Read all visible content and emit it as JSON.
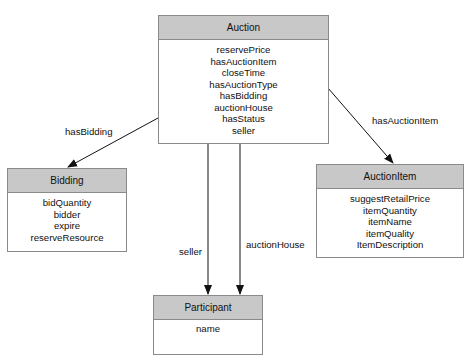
{
  "diagram": {
    "type": "class-relationship",
    "colors": {
      "header_fill": "#c8c8c8",
      "border": "#8a8a8a",
      "edge": "#111111",
      "background": "#ffffff"
    },
    "classes": {
      "auction": {
        "name": "Auction",
        "attributes": [
          "reservePrice",
          "hasAuctionItem",
          "closeTime",
          "hasAuctionType",
          "hasBidding",
          "auctionHouse",
          "hasStatus",
          "seller"
        ]
      },
      "bidding": {
        "name": "Bidding",
        "attributes": [
          "bidQuantity",
          "bidder",
          "expire",
          "reserveResource"
        ]
      },
      "auction_item": {
        "name": "AuctionItem",
        "attributes": [
          "suggestRetailPrice",
          "itemQuantity",
          "itemName",
          "itemQuality",
          "ItemDescription"
        ]
      },
      "participant": {
        "name": "Participant",
        "attributes": [
          "name"
        ]
      }
    },
    "edges": {
      "has_bidding": {
        "label": "hasBidding",
        "from": "Auction",
        "to": "Bidding"
      },
      "has_auction_item": {
        "label": "hasAuctionItem",
        "from": "Auction",
        "to": "AuctionItem"
      },
      "seller": {
        "label": "seller",
        "from": "Auction",
        "to": "Participant"
      },
      "auction_house": {
        "label": "auctionHouse",
        "from": "Auction",
        "to": "Participant"
      }
    }
  }
}
